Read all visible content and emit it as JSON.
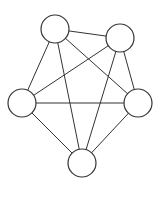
{
  "diagram": {
    "type": "complete-graph",
    "name": "K5",
    "stroke_color": "#333333",
    "fill_color": "#ffffff",
    "nodes": [
      {
        "id": "top-left",
        "cx": 55,
        "cy": 29,
        "r": 14
      },
      {
        "id": "top-right",
        "cx": 120,
        "cy": 38,
        "r": 14
      },
      {
        "id": "left",
        "cx": 22,
        "cy": 103,
        "r": 14
      },
      {
        "id": "right",
        "cx": 138,
        "cy": 103,
        "r": 14
      },
      {
        "id": "bottom",
        "cx": 82,
        "cy": 163,
        "r": 14
      }
    ],
    "edges": [
      [
        "top-left",
        "top-right"
      ],
      [
        "top-left",
        "left"
      ],
      [
        "top-left",
        "right"
      ],
      [
        "top-left",
        "bottom"
      ],
      [
        "top-right",
        "left"
      ],
      [
        "top-right",
        "right"
      ],
      [
        "top-right",
        "bottom"
      ],
      [
        "left",
        "right"
      ],
      [
        "left",
        "bottom"
      ],
      [
        "right",
        "bottom"
      ]
    ]
  }
}
